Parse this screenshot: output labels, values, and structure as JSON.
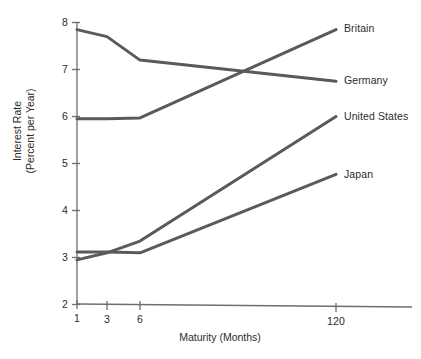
{
  "chart_data": {
    "type": "line",
    "title": "",
    "xlabel": "Maturity (Months)",
    "ylabel": "Interest Rate\n(Percent per Year)",
    "ylabel_line1": "Interest Rate",
    "ylabel_line2": "(Percent per Year)",
    "x": [
      1,
      3,
      6,
      120
    ],
    "xtick_labels": [
      "1",
      "3",
      "6",
      "120"
    ],
    "ytick_labels": [
      "8",
      "7",
      "6",
      "5",
      "4",
      "3",
      "2"
    ],
    "yticks": [
      8,
      7,
      6,
      5,
      4,
      3,
      2
    ],
    "ylim": [
      2,
      8
    ],
    "grid": false,
    "legend_position": "right-inline-labels",
    "series": [
      {
        "name": "Germany",
        "values": [
          7.85,
          7.7,
          7.2,
          6.75
        ],
        "label": "Germany"
      },
      {
        "name": "Britain",
        "values": [
          5.95,
          5.95,
          5.97,
          7.85
        ],
        "label": "Britain"
      },
      {
        "name": "Japan",
        "values": [
          3.12,
          3.12,
          3.1,
          4.77
        ],
        "label": "Japan"
      },
      {
        "name": "United States",
        "values": [
          2.95,
          3.1,
          3.35,
          6.0
        ],
        "label": "United States"
      }
    ],
    "series_color": "#5a5a5a",
    "axis_color": "#6e6e6e",
    "background": "#ffffff"
  },
  "axis": {
    "y_title_line1": "Interest Rate",
    "y_title_line2": "(Percent per Year)",
    "x_title": "Maturity (Months)"
  },
  "ylabels": {
    "t8": "8",
    "t7": "7",
    "t6": "6",
    "t5": "5",
    "t4": "4",
    "t3": "3",
    "t2": "2"
  },
  "xlabels": {
    "t1": "1",
    "t3": "3",
    "t6": "6",
    "t120": "120"
  },
  "series_labels": {
    "britain": "Britain",
    "germany": "Germany",
    "united_states": "United States",
    "japan": "Japan"
  }
}
